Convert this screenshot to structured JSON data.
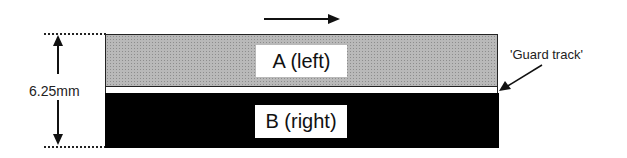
{
  "diagram": {
    "direction_arrow": "right",
    "track_a_label": "A (left)",
    "track_b_label": "B (right)",
    "dimension_label": "6.25mm",
    "guard_label": "'Guard track'",
    "colors": {
      "track_a": "#b9b9b9",
      "track_b": "#000000",
      "guard": "#ffffff"
    }
  }
}
